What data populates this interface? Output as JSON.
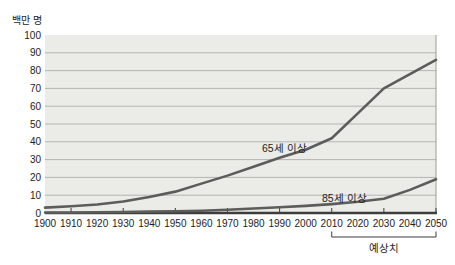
{
  "chart_data": {
    "type": "line",
    "title": "",
    "ylabel": "백만 명",
    "xlabel": "",
    "xlim": [
      1900,
      2050
    ],
    "ylim": [
      0,
      100
    ],
    "grid": "horizontal",
    "x": [
      1900,
      1910,
      1920,
      1930,
      1940,
      1950,
      1960,
      1970,
      1980,
      1990,
      2000,
      2010,
      2020,
      2030,
      2040,
      2050
    ],
    "y_ticks": [
      0,
      10,
      20,
      30,
      40,
      50,
      60,
      70,
      80,
      90,
      100
    ],
    "series": [
      {
        "name": "65세 이상",
        "values": [
          3,
          3.8,
          4.8,
          6.5,
          9,
          12,
          16.5,
          21,
          26,
          31,
          35.5,
          42,
          56,
          70,
          78,
          86
        ]
      },
      {
        "name": "85세 이상",
        "values": [
          0.3,
          0.3,
          0.4,
          0.6,
          0.8,
          1,
          1.3,
          1.8,
          2.5,
          3.2,
          4,
          5,
          6.3,
          8,
          13,
          19
        ]
      }
    ],
    "annotations": {
      "forecast_label": "예상치",
      "forecast_range": [
        2010,
        2050
      ]
    },
    "colors": {
      "line": "#5c5c5a",
      "plot_background": "#ebebe7",
      "gridline": "#b4b4b1",
      "plot_border": "#9b9b98",
      "axis": "#3d3d3b",
      "text": "#1c1c1c"
    }
  }
}
